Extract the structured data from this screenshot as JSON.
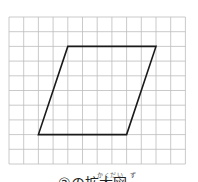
{
  "figure": {
    "grid": {
      "columns": 12,
      "rows": 10,
      "origin_x": 9,
      "origin_y": 17,
      "cell_size": 14.7,
      "line_color": "#bdbdbd"
    },
    "shape": {
      "type": "parallelogram",
      "vertices_grid": [
        [
          4,
          2
        ],
        [
          10,
          2
        ],
        [
          8,
          8
        ],
        [
          2,
          8
        ]
      ],
      "stroke_color": "#1a1a1a",
      "stroke_width": 1.6
    }
  },
  "caption": {
    "ruby": "かくだい　ず",
    "text": "②の拡大図"
  }
}
